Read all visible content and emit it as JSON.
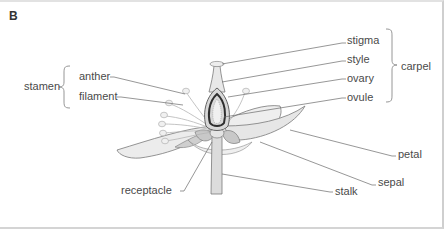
{
  "panel": {
    "letter": "B"
  },
  "labels": {
    "stamen": "stamen",
    "anther": "anther",
    "filament": "filament",
    "stigma": "stigma",
    "style": "style",
    "ovary": "ovary",
    "ovule": "ovule",
    "carpel": "carpel",
    "petal": "petal",
    "sepal": "sepal",
    "receptacle": "receptacle",
    "stalk": "stalk"
  },
  "colors": {
    "text": "#4a4a4a",
    "leader_line": "#6a6a6a",
    "flower_fill": "#e8e8e8",
    "flower_stroke": "#7a7a7a",
    "ovary_dark": "#3a3a3a"
  }
}
